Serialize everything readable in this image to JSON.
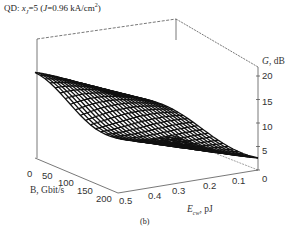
{
  "figure": {
    "title_parts": {
      "prefix": "QD: ",
      "var": "x",
      "sub": "J",
      "mid": "=5 (",
      "var2": "J",
      "rest": "=0.96 kA/cm",
      "sup": "2",
      "end": ")"
    },
    "caption": "(b)"
  },
  "chart_data": {
    "type": "surface3d",
    "x": {
      "label": "B, Gbit/s",
      "ticks": [
        0,
        50,
        100,
        150,
        200
      ],
      "range": [
        0,
        200
      ]
    },
    "y": {
      "label": "E_cw, pJ",
      "ticks": [
        0.5,
        0.4,
        0.3,
        0.2,
        0.1,
        0
      ],
      "range": [
        0,
        0.5
      ]
    },
    "z": {
      "label": "G, dB",
      "ticks": [
        0,
        5,
        10,
        15,
        20
      ],
      "range": [
        0,
        22
      ]
    },
    "grid": false,
    "mesh_color": "#111111"
  },
  "axes": {
    "z_label": "G, dB",
    "z_ticks": [
      "20",
      "15",
      "10",
      "5",
      "0"
    ],
    "x_label": "B, Gbit/s",
    "x_ticks": [
      "0",
      "50",
      "100",
      "150",
      "200"
    ],
    "y_label_main": "E",
    "y_label_sub": "cw",
    "y_label_unit": ", pJ",
    "y_ticks": [
      "0.5",
      "0.4",
      "0.3",
      "0.2",
      "0.1",
      "0"
    ]
  }
}
